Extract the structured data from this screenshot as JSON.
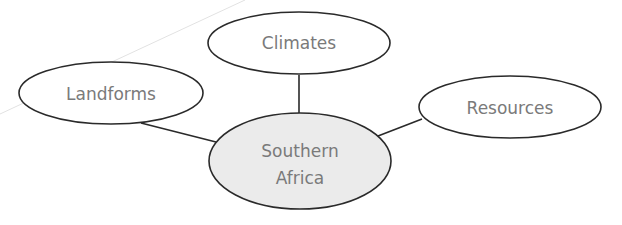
{
  "diagram": {
    "type": "concept-web",
    "center": {
      "label_line1": "Southern",
      "label_line2": "Africa",
      "fill": "#ebebeb"
    },
    "nodes": [
      {
        "id": "climates",
        "label": "Climates"
      },
      {
        "id": "landforms",
        "label": "Landforms"
      },
      {
        "id": "resources",
        "label": "Resources"
      }
    ],
    "edges": [
      {
        "from": "climates",
        "to": "center"
      },
      {
        "from": "landforms",
        "to": "center"
      },
      {
        "from": "resources",
        "to": "center"
      }
    ],
    "colors": {
      "stroke": "#2a2a2a",
      "text": "#7a7a7a",
      "node_fill": "#ffffff",
      "center_fill": "#ebebeb"
    }
  }
}
